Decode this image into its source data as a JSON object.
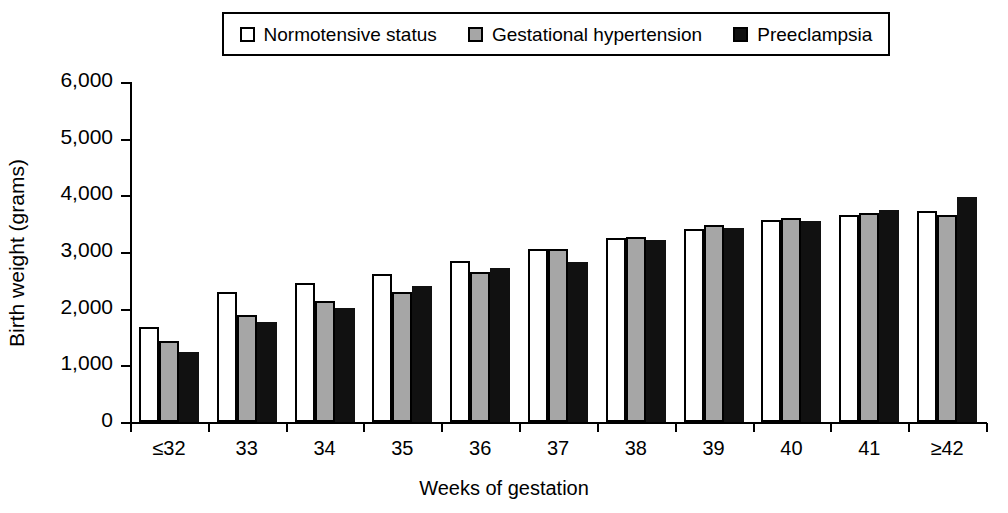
{
  "legend": {
    "items": [
      {
        "label": "Normotensive status",
        "swatch": "white",
        "color": "#ffffff"
      },
      {
        "label": "Gestational hypertension",
        "swatch": "gray",
        "color": "#a6a6a6"
      },
      {
        "label": "Preeclampsia",
        "swatch": "black",
        "color": "#111111"
      }
    ]
  },
  "axes": {
    "ylabel": "Birth weight (grams)",
    "xlabel": "Weeks of gestation",
    "yticks": [
      "0",
      "1,000",
      "2,000",
      "3,000",
      "4,000",
      "5,000",
      "6,000"
    ]
  },
  "chart_data": {
    "type": "bar",
    "title": "",
    "xlabel": "Weeks of gestation",
    "ylabel": "Birth weight (grams)",
    "ylim": [
      0,
      6000
    ],
    "ytick_values": [
      0,
      1000,
      2000,
      3000,
      4000,
      5000,
      6000
    ],
    "grid": false,
    "legend_position": "top",
    "categories": [
      "≤32",
      "33",
      "34",
      "35",
      "36",
      "37",
      "38",
      "39",
      "40",
      "41",
      "≥42"
    ],
    "series": [
      {
        "name": "Normotensive status",
        "color": "#ffffff",
        "values": [
          1680,
          2300,
          2450,
          2610,
          2840,
          3060,
          3250,
          3400,
          3560,
          3660,
          3720
        ]
      },
      {
        "name": "Gestational hypertension",
        "color": "#a6a6a6",
        "values": [
          1430,
          1880,
          2140,
          2290,
          2650,
          3050,
          3270,
          3470,
          3600,
          3680,
          3660
        ]
      },
      {
        "name": "Preeclampsia",
        "color": "#111111",
        "values": [
          1230,
          1760,
          2020,
          2400,
          2710,
          2820,
          3210,
          3420,
          3540,
          3750,
          3970
        ]
      }
    ]
  }
}
